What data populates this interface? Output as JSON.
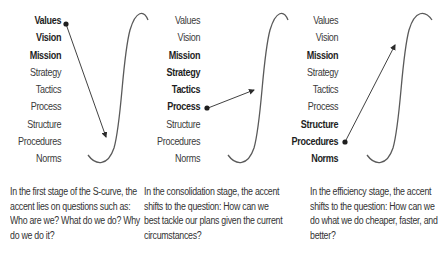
{
  "diagram": {
    "type": "s-curve-stages",
    "levels": [
      "Values",
      "Vision",
      "Mission",
      "Strategy",
      "Tactics",
      "Process",
      "Structure",
      "Procedures",
      "Norms"
    ],
    "panels": [
      {
        "stage": "first",
        "labels": [
          {
            "text": "Values",
            "bold": true
          },
          {
            "text": "Vision",
            "bold": true
          },
          {
            "text": "Mission",
            "bold": true
          },
          {
            "text": "Strategy",
            "bold": false
          },
          {
            "text": "Tactics",
            "bold": false
          },
          {
            "text": "Process",
            "bold": false
          },
          {
            "text": "Structure",
            "bold": false
          },
          {
            "text": "Procedures",
            "bold": false
          },
          {
            "text": "Norms",
            "bold": false
          }
        ],
        "arrow_from": "Values",
        "arrow_direction": "down toward the bottom of the S-curve",
        "caption": "In the first stage of the S-curve, the accent lies on questions such as:  Who are we? What do we do? Why do we do it?"
      },
      {
        "stage": "consolidation",
        "labels": [
          {
            "text": "Values",
            "bold": false
          },
          {
            "text": "Vision",
            "bold": false
          },
          {
            "text": "Mission",
            "bold": true
          },
          {
            "text": "Strategy",
            "bold": true
          },
          {
            "text": "Tactics",
            "bold": true
          },
          {
            "text": "Process",
            "bold": true
          },
          {
            "text": "Structure",
            "bold": false
          },
          {
            "text": "Procedures",
            "bold": false
          },
          {
            "text": "Norms",
            "bold": false
          }
        ],
        "arrow_from": "Process",
        "arrow_direction": "slightly up toward the middle of the S-curve",
        "caption": "In the consolidation stage, the accent shifts to the question: How can we best tackle our plans given the current circumstances?"
      },
      {
        "stage": "efficiency",
        "labels": [
          {
            "text": "Values",
            "bold": false
          },
          {
            "text": "Vision",
            "bold": false
          },
          {
            "text": "Mission",
            "bold": true
          },
          {
            "text": "Strategy",
            "bold": false
          },
          {
            "text": "Tactics",
            "bold": false
          },
          {
            "text": "Process",
            "bold": false
          },
          {
            "text": "Structure",
            "bold": true
          },
          {
            "text": "Procedures",
            "bold": true
          },
          {
            "text": "Norms",
            "bold": true
          }
        ],
        "arrow_from": "Procedures",
        "arrow_direction": "up toward the top of the S-curve",
        "caption": "In the efficiency stage, the accent shifts to the question: How can we do what we do cheaper, faster, and better?"
      }
    ],
    "colors": {
      "text": "#333333",
      "bold_text": "#1e1e1e",
      "curve": "#555555",
      "arrow": "#333333"
    }
  }
}
